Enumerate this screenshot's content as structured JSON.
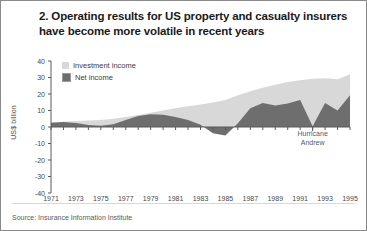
{
  "figure": {
    "title_lines": [
      "2. Operating results for US property and casualty insurers",
      "have become more volatile in recent years"
    ],
    "source": "Source: Insurance Information Institute"
  },
  "colors": {
    "investment_income": "#d8d8d8",
    "net_income": "#6e6e6e",
    "axis": "#5a5a5a",
    "text": "#3d3d3d",
    "frame": "#8a8a8a"
  },
  "legend": {
    "position": "top-left-inside",
    "items": [
      {
        "label": "Investment income",
        "color": "#d8d8d8",
        "swatch": "square-light"
      },
      {
        "label": "Net income",
        "color": "#6e6e6e",
        "swatch": "square-dark"
      }
    ]
  },
  "annotations": [
    {
      "text_line1": "Hurricane",
      "text_line2": "Andrew",
      "x_year": 1992,
      "points_to_value": 0.3
    }
  ],
  "chart_data": {
    "type": "area",
    "title": "2. Operating results for US property and casualty insurers have become more volatile in recent years",
    "xlabel": "",
    "ylabel": "US$ billion",
    "xlim": [
      1971,
      1995
    ],
    "ylim": [
      -40,
      40
    ],
    "yticks": [
      40,
      30,
      20,
      10,
      0,
      -10,
      -20,
      -30,
      -40
    ],
    "ytick_labels": [
      "40",
      "30",
      "20",
      "10",
      "0",
      "-10",
      "-20",
      "-30",
      "-40"
    ],
    "xticks": [
      1971,
      1973,
      1975,
      1977,
      1979,
      1981,
      1983,
      1985,
      1987,
      1989,
      1991,
      1993,
      1995
    ],
    "xtick_labels": [
      "1971",
      "1973",
      "1975",
      "1977",
      "1979",
      "1981",
      "1983",
      "1985",
      "1987",
      "1989",
      "1991",
      "1993",
      "1995"
    ],
    "grid": false,
    "stacked": false,
    "x": [
      1971,
      1972,
      1973,
      1974,
      1975,
      1976,
      1977,
      1978,
      1979,
      1980,
      1981,
      1982,
      1983,
      1984,
      1985,
      1986,
      1987,
      1988,
      1989,
      1990,
      1991,
      1992,
      1993,
      1994,
      1995
    ],
    "series": [
      {
        "name": "Investment income",
        "color": "#d8d8d8",
        "values": [
          2.8,
          3.2,
          3.6,
          3.9,
          4.3,
          5.0,
          6.0,
          7.2,
          8.6,
          10.0,
          11.4,
          12.6,
          13.6,
          14.8,
          16.4,
          19.2,
          21.6,
          23.8,
          25.6,
          27.2,
          28.4,
          29.2,
          29.6,
          29.0,
          32.0
        ]
      },
      {
        "name": "Net income",
        "color": "#6e6e6e",
        "values": [
          2.6,
          3.0,
          2.4,
          1.2,
          0.7,
          1.6,
          4.2,
          6.6,
          7.8,
          7.4,
          6.0,
          4.2,
          1.4,
          -3.8,
          -5.2,
          2.2,
          11.4,
          14.6,
          13.0,
          14.2,
          16.4,
          0.4,
          14.6,
          10.0,
          19.2
        ]
      }
    ]
  }
}
